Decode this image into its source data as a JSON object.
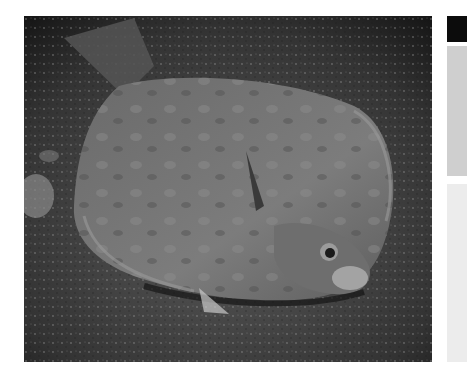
{
  "photo": {
    "subject": "flatfish (flounder) camouflaged on sandy seabed",
    "alt": "Flounder lying on dark speckled sand"
  },
  "side_card": {
    "top_color": "#0c0c0c",
    "mid_color": "#cfcfcf",
    "bottom_color": "#ececec"
  }
}
